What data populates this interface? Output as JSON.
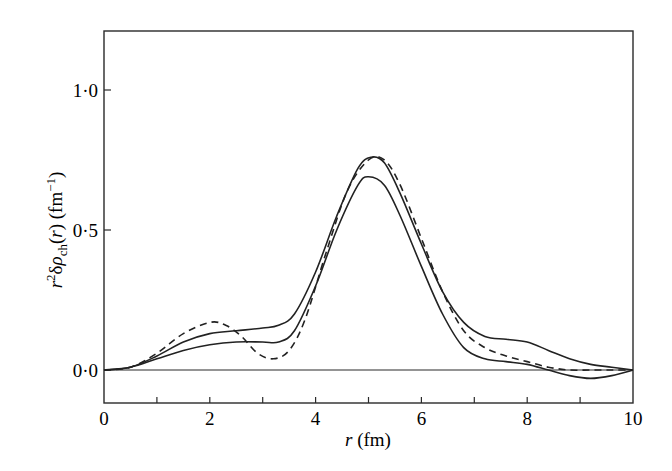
{
  "chart_data": {
    "type": "line",
    "title": "",
    "xlabel": "r (fm)",
    "ylabel": "r²δρ_ch(r) (fm⁻¹)",
    "xlim": [
      0,
      10
    ],
    "ylim": [
      -0.12,
      1.22
    ],
    "x_ticks": [
      0,
      2,
      4,
      6,
      8,
      10
    ],
    "x_tick_labels": [
      "0",
      "2",
      "4",
      "6",
      "8",
      "10"
    ],
    "x_minor_ticks": [
      1,
      3,
      5,
      7,
      9
    ],
    "y_ticks": [
      0.0,
      0.5,
      1.0
    ],
    "y_tick_labels": [
      "0·0",
      "0·5",
      "1·0"
    ],
    "grid": false,
    "legend": null,
    "zero_line": true,
    "series": [
      {
        "name": "solid-upper",
        "style": "solid",
        "x": [
          0,
          0.5,
          1.0,
          1.5,
          2.0,
          2.5,
          3.0,
          3.3,
          3.6,
          4.0,
          4.4,
          4.8,
          5.05,
          5.3,
          5.6,
          6.0,
          6.4,
          6.8,
          7.2,
          7.6,
          8.0,
          8.4,
          8.8,
          9.2,
          9.6,
          10.0
        ],
        "y": [
          0,
          0.01,
          0.05,
          0.1,
          0.13,
          0.14,
          0.15,
          0.16,
          0.2,
          0.35,
          0.55,
          0.72,
          0.76,
          0.74,
          0.63,
          0.45,
          0.28,
          0.17,
          0.12,
          0.11,
          0.1,
          0.07,
          0.04,
          0.02,
          0.01,
          0
        ]
      },
      {
        "name": "solid-lower",
        "style": "solid",
        "x": [
          0,
          0.5,
          1.0,
          1.5,
          2.0,
          2.5,
          3.0,
          3.3,
          3.6,
          4.0,
          4.4,
          4.8,
          5.0,
          5.3,
          5.6,
          6.0,
          6.4,
          6.8,
          7.2,
          7.6,
          8.0,
          8.4,
          8.8,
          9.2,
          9.6,
          10.0
        ],
        "y": [
          0,
          0.01,
          0.04,
          0.07,
          0.09,
          0.1,
          0.1,
          0.1,
          0.14,
          0.3,
          0.5,
          0.66,
          0.69,
          0.66,
          0.55,
          0.37,
          0.2,
          0.08,
          0.04,
          0.03,
          0.02,
          0.0,
          -0.02,
          -0.03,
          -0.02,
          0
        ]
      },
      {
        "name": "dashed",
        "style": "dashed",
        "x": [
          0,
          0.5,
          1.0,
          1.5,
          2.0,
          2.3,
          2.6,
          2.9,
          3.2,
          3.5,
          3.8,
          4.2,
          4.6,
          5.0,
          5.3,
          5.6,
          6.0,
          6.4,
          6.8,
          7.2,
          7.6,
          8.0,
          8.4,
          8.8,
          9.2,
          9.6,
          10.0
        ],
        "y": [
          0,
          0.01,
          0.06,
          0.13,
          0.17,
          0.16,
          0.12,
          0.06,
          0.04,
          0.07,
          0.18,
          0.42,
          0.64,
          0.75,
          0.75,
          0.66,
          0.47,
          0.28,
          0.14,
          0.08,
          0.05,
          0.03,
          0.01,
          0.0,
          0.0,
          0.0,
          0
        ]
      }
    ]
  }
}
